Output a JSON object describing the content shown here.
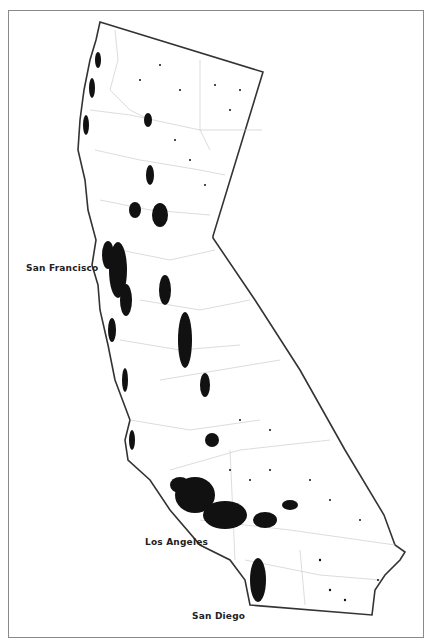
{
  "map": {
    "subject": "California population dot-density map",
    "colors": {
      "background": "#ffffff",
      "state_border": "#333333",
      "county_lines": "#bbbbbb",
      "dots": "#111111",
      "frame": "#8a8a8a"
    },
    "labels": [
      {
        "id": "san-francisco",
        "text": "San Francisco",
        "x": 26,
        "y": 263
      },
      {
        "id": "los-angeles",
        "text": "Los Angeles",
        "x": 145,
        "y": 537
      },
      {
        "id": "san-diego",
        "text": "San Diego",
        "x": 192,
        "y": 611
      }
    ]
  }
}
